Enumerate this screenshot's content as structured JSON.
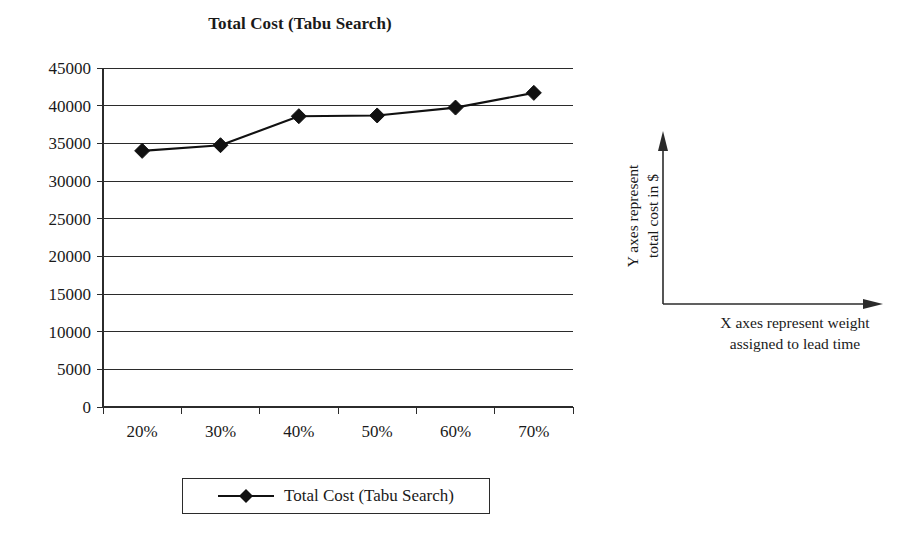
{
  "chart_data": {
    "type": "line",
    "title": "Total Cost (Tabu Search)",
    "xlabel": "",
    "ylabel": "",
    "categories": [
      "20%",
      "30%",
      "40%",
      "50%",
      "60%",
      "70%"
    ],
    "series": [
      {
        "name": "Total Cost (Tabu Search)",
        "values": [
          34000,
          34750,
          38600,
          38700,
          39750,
          41700
        ],
        "marker": "diamond",
        "color": "#111111"
      }
    ],
    "ylim": [
      0,
      45000
    ],
    "yticks": [
      0,
      5000,
      10000,
      15000,
      20000,
      25000,
      30000,
      35000,
      40000,
      45000
    ],
    "ytick_labels": [
      "0",
      "5000",
      "10000",
      "15000",
      "20000",
      "25000",
      "30000",
      "35000",
      "40000",
      "45000"
    ],
    "grid": "horizontal",
    "legend": {
      "position": "bottom",
      "entries": [
        "Total Cost (Tabu Search)"
      ]
    }
  },
  "legend": {
    "label": "Total Cost (Tabu Search)"
  },
  "axis_note": {
    "y_text": "Y axes represent total cost in $",
    "y_line1": "Y axes represent",
    "y_line2": "total cost in $",
    "x_line1": "X axes represent weight",
    "x_line2": "assigned to lead time"
  }
}
